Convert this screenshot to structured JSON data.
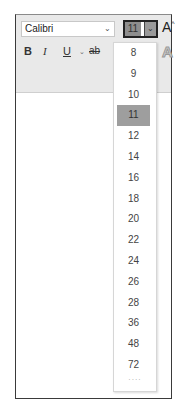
{
  "toolbar": {
    "font_name": "Calibri",
    "font_name_chevron": "⌄",
    "font_size": "11",
    "font_size_chevron": "⌄",
    "grow_font_label": "A",
    "grow_font_sup": "^",
    "bold_label": "B",
    "italic_label": "I",
    "underline_label": "U",
    "underline_chevron": "⌄",
    "strikethrough_label": "ab",
    "text_effects_label": "A"
  },
  "dropdown": {
    "selected": "11",
    "items": [
      "8",
      "9",
      "10",
      "11",
      "12",
      "14",
      "16",
      "18",
      "20",
      "22",
      "24",
      "26",
      "28",
      "36",
      "48",
      "72"
    ],
    "more_indicator": "····"
  }
}
